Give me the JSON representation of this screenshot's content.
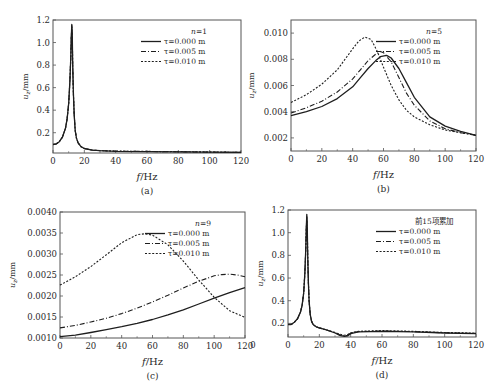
{
  "figure": {
    "background": "#ffffff",
    "line_color": "#1e1e1e",
    "frame_color": "#555555"
  },
  "chart_data": [
    {
      "id": "a",
      "type": "line",
      "caption": "(a)",
      "xlabel": "f/Hz",
      "ylabel": "u_z/mm",
      "xlim": [
        0,
        120
      ],
      "ylim": [
        0.02,
        1.2
      ],
      "xticks": [
        0,
        20,
        40,
        60,
        80,
        100,
        120
      ],
      "yticks": [
        0.2,
        0.4,
        0.6,
        0.8,
        1.0
      ],
      "ytick_labels": [
        "0.2",
        "0.4",
        "0.6",
        "0.8",
        "1.0",
        "1.2"
      ],
      "ytick_label_values": [
        0.2,
        0.4,
        0.6,
        0.8,
        1.0,
        1.2
      ],
      "legend_title": "n=1",
      "legend_position": "upper right",
      "frame": {
        "x": 53,
        "y": 20,
        "w": 188,
        "h": 133
      },
      "series": [
        {
          "name": "τ=0.000 m",
          "style": "solid",
          "x": [
            0,
            2,
            4,
            6,
            8,
            9,
            10,
            10.8,
            11.3,
            11.7,
            12.0,
            12.3,
            12.6,
            13.0,
            13.5,
            14.2,
            15,
            16,
            18,
            20,
            25,
            30,
            40,
            60,
            80,
            100,
            120
          ],
          "y": [
            0.095,
            0.1,
            0.12,
            0.16,
            0.24,
            0.32,
            0.46,
            0.66,
            0.85,
            1.05,
            1.16,
            1.05,
            0.8,
            0.55,
            0.36,
            0.22,
            0.15,
            0.11,
            0.075,
            0.06,
            0.045,
            0.04,
            0.035,
            0.032,
            0.03,
            0.028,
            0.025
          ]
        },
        {
          "name": "τ=0.005 m",
          "style": "dashdot",
          "x": [
            0,
            2,
            4,
            6,
            8,
            9,
            10,
            10.8,
            11.3,
            11.7,
            12.0,
            12.3,
            12.6,
            13.0,
            13.5,
            14.2,
            15,
            16,
            18,
            20,
            25,
            30,
            40,
            60,
            80,
            100,
            120
          ],
          "y": [
            0.095,
            0.1,
            0.12,
            0.16,
            0.24,
            0.32,
            0.46,
            0.66,
            0.85,
            1.05,
            1.15,
            1.04,
            0.8,
            0.55,
            0.36,
            0.22,
            0.15,
            0.11,
            0.075,
            0.06,
            0.045,
            0.04,
            0.036,
            0.033,
            0.031,
            0.028,
            0.025
          ]
        },
        {
          "name": "τ=0.010 m",
          "style": "dotted",
          "x": [
            0,
            2,
            4,
            6,
            8,
            9,
            10,
            10.8,
            11.3,
            11.7,
            12.0,
            12.3,
            12.6,
            13.0,
            13.5,
            14.2,
            15,
            16,
            18,
            20,
            25,
            30,
            40,
            60,
            80,
            100,
            120
          ],
          "y": [
            0.095,
            0.1,
            0.12,
            0.16,
            0.24,
            0.32,
            0.46,
            0.66,
            0.85,
            1.05,
            1.14,
            1.04,
            0.8,
            0.55,
            0.36,
            0.22,
            0.15,
            0.11,
            0.075,
            0.06,
            0.046,
            0.041,
            0.037,
            0.034,
            0.032,
            0.029,
            0.026
          ]
        }
      ]
    },
    {
      "id": "b",
      "type": "line",
      "caption": "(b)",
      "xlabel": "f/Hz",
      "ylabel": "u_z/mm",
      "xlim": [
        0,
        120
      ],
      "ylim": [
        0.001,
        0.011
      ],
      "xticks": [
        0,
        20,
        40,
        60,
        80,
        100,
        120
      ],
      "yticks": [
        0.002,
        0.004,
        0.006,
        0.008,
        0.01
      ],
      "ytick_labels": [
        "0.002",
        "0.004",
        "0.006",
        "0.008",
        "0.010"
      ],
      "ytick_label_values": [
        0.002,
        0.004,
        0.006,
        0.008,
        0.01
      ],
      "legend_title": "n=5",
      "legend_position": "upper right",
      "frame": {
        "x": 291,
        "y": 20,
        "w": 185,
        "h": 131
      },
      "series": [
        {
          "name": "τ=0.000 m",
          "style": "solid",
          "x": [
            0,
            10,
            20,
            30,
            40,
            45,
            50,
            55,
            58,
            62,
            65,
            70,
            75,
            80,
            90,
            100,
            110,
            120
          ],
          "y": [
            0.0037,
            0.004,
            0.0044,
            0.005,
            0.0059,
            0.0066,
            0.0073,
            0.0079,
            0.0082,
            0.0083,
            0.0081,
            0.0073,
            0.0062,
            0.0051,
            0.0036,
            0.0029,
            0.0025,
            0.0022
          ]
        },
        {
          "name": "τ=0.005 m",
          "style": "dashdot",
          "x": [
            0,
            10,
            20,
            30,
            40,
            45,
            50,
            55,
            58,
            60,
            65,
            70,
            75,
            80,
            90,
            100,
            110,
            120
          ],
          "y": [
            0.0039,
            0.0043,
            0.0048,
            0.0055,
            0.0065,
            0.0072,
            0.0079,
            0.0084,
            0.0086,
            0.0085,
            0.0078,
            0.0066,
            0.0054,
            0.0045,
            0.0033,
            0.0027,
            0.0024,
            0.0022
          ]
        },
        {
          "name": "τ=0.010 m",
          "style": "dotted",
          "x": [
            0,
            10,
            20,
            30,
            40,
            44,
            48,
            52,
            56,
            60,
            65,
            70,
            75,
            80,
            90,
            100,
            110,
            120
          ],
          "y": [
            0.0047,
            0.0053,
            0.0061,
            0.0072,
            0.0088,
            0.0094,
            0.0097,
            0.0095,
            0.0086,
            0.0074,
            0.006,
            0.0049,
            0.0041,
            0.0036,
            0.003,
            0.0026,
            0.0024,
            0.0022
          ]
        }
      ]
    },
    {
      "id": "c",
      "type": "line",
      "caption": "(c)",
      "xlabel": "f/Hz",
      "ylabel": "u_z/mm",
      "xlim": [
        0,
        120
      ],
      "ylim": [
        0.001,
        0.004
      ],
      "xticks": [
        0,
        20,
        40,
        60,
        80,
        100,
        120
      ],
      "yticks": [
        0.0015,
        0.002,
        0.0025,
        0.003,
        0.0035
      ],
      "ytick_labels": [
        "0.0010",
        "0.0015",
        "0.0020",
        "0.0025",
        "0.0030",
        "0.0035",
        "0.0040"
      ],
      "ytick_label_values": [
        0.001,
        0.0015,
        0.002,
        0.0025,
        0.003,
        0.0035,
        0.004
      ],
      "legend_title": "n=9",
      "legend_position": "upper right",
      "frame": {
        "x": 60,
        "y": 212,
        "w": 185,
        "h": 126
      },
      "series": [
        {
          "name": "τ=0.000 m",
          "style": "solid",
          "x": [
            0,
            10,
            20,
            30,
            40,
            50,
            60,
            70,
            80,
            90,
            100,
            110,
            120
          ],
          "y": [
            0.00103,
            0.00107,
            0.00113,
            0.0012,
            0.00127,
            0.00135,
            0.00144,
            0.00155,
            0.00167,
            0.00181,
            0.00195,
            0.00208,
            0.0022
          ]
        },
        {
          "name": "τ=0.005 m",
          "style": "dashdot",
          "x": [
            0,
            10,
            20,
            30,
            40,
            50,
            60,
            70,
            80,
            90,
            100,
            105,
            110,
            115,
            120
          ],
          "y": [
            0.00124,
            0.0013,
            0.00138,
            0.00147,
            0.00158,
            0.00171,
            0.00186,
            0.00202,
            0.00219,
            0.00235,
            0.00248,
            0.00251,
            0.00252,
            0.0025,
            0.00246
          ]
        },
        {
          "name": "τ=0.010 m",
          "style": "dotted",
          "x": [
            0,
            10,
            20,
            30,
            40,
            50,
            55,
            60,
            70,
            80,
            90,
            100,
            110,
            120
          ],
          "y": [
            0.00226,
            0.00246,
            0.0027,
            0.00298,
            0.00327,
            0.00346,
            0.00348,
            0.00345,
            0.00322,
            0.00283,
            0.00238,
            0.00197,
            0.00165,
            0.00149
          ]
        }
      ]
    },
    {
      "id": "d",
      "type": "line",
      "caption": "(d)",
      "xlabel": "f/Hz",
      "ylabel": "u_z/mm",
      "xlim": [
        0,
        120
      ],
      "ylim": [
        0.08,
        1.2
      ],
      "xticks": [
        0,
        20,
        40,
        60,
        80,
        100,
        120
      ],
      "yticks": [
        0.2,
        0.4,
        0.6,
        0.8,
        1.0
      ],
      "ytick_labels": [
        "0.2",
        "0.4",
        "0.6",
        "0.8",
        "1.0",
        "1.2"
      ],
      "ytick_label_values": [
        0.2,
        0.4,
        0.6,
        0.8,
        1.0,
        1.2
      ],
      "legend_title": "前15项累加",
      "legend_position": "upper right",
      "frame": {
        "x": 288,
        "y": 210,
        "w": 188,
        "h": 127
      },
      "series": [
        {
          "name": "τ=0.000 m",
          "style": "solid",
          "x": [
            0,
            2,
            4,
            6,
            8,
            9,
            10,
            10.8,
            11.3,
            11.7,
            12.0,
            12.3,
            12.6,
            13.0,
            13.5,
            14.2,
            15,
            16,
            18,
            20,
            25,
            30,
            33,
            36,
            38,
            40,
            45,
            60,
            80,
            100,
            120
          ],
          "y": [
            0.19,
            0.19,
            0.21,
            0.24,
            0.3,
            0.36,
            0.47,
            0.65,
            0.84,
            1.04,
            1.16,
            1.03,
            0.8,
            0.56,
            0.4,
            0.28,
            0.22,
            0.19,
            0.17,
            0.16,
            0.14,
            0.115,
            0.095,
            0.085,
            0.09,
            0.11,
            0.125,
            0.13,
            0.125,
            0.115,
            0.11
          ]
        },
        {
          "name": "τ=0.005 m",
          "style": "dashdot",
          "x": [
            0,
            2,
            4,
            6,
            8,
            9,
            10,
            10.8,
            11.3,
            11.7,
            12.0,
            12.3,
            12.6,
            13.0,
            13.5,
            14.2,
            15,
            16,
            18,
            20,
            25,
            30,
            33,
            36,
            38,
            40,
            45,
            60,
            80,
            100,
            120
          ],
          "y": [
            0.19,
            0.19,
            0.21,
            0.24,
            0.3,
            0.36,
            0.47,
            0.65,
            0.84,
            1.04,
            1.15,
            1.03,
            0.8,
            0.56,
            0.4,
            0.28,
            0.22,
            0.19,
            0.17,
            0.16,
            0.14,
            0.12,
            0.1,
            0.09,
            0.095,
            0.115,
            0.128,
            0.133,
            0.128,
            0.117,
            0.112
          ]
        },
        {
          "name": "τ=0.010 m",
          "style": "dotted",
          "x": [
            0,
            2,
            4,
            6,
            8,
            9,
            10,
            10.8,
            11.3,
            11.7,
            12.0,
            12.3,
            12.6,
            13.0,
            13.5,
            14.2,
            15,
            16,
            18,
            20,
            25,
            30,
            33,
            36,
            38,
            40,
            45,
            60,
            80,
            100,
            120
          ],
          "y": [
            0.19,
            0.19,
            0.21,
            0.24,
            0.3,
            0.36,
            0.47,
            0.65,
            0.84,
            1.04,
            1.14,
            1.03,
            0.8,
            0.56,
            0.4,
            0.28,
            0.22,
            0.19,
            0.17,
            0.16,
            0.14,
            0.12,
            0.105,
            0.095,
            0.1,
            0.118,
            0.13,
            0.136,
            0.13,
            0.12,
            0.114
          ]
        }
      ]
    }
  ]
}
